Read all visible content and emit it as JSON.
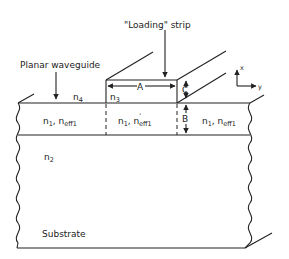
{
  "figure": {
    "labels": {
      "loading_strip": "\"Loading\" strip",
      "planar_waveguide": "Planar waveguide",
      "substrate": "Substrate",
      "n4": "n",
      "n4_sub": "4",
      "n3": "n",
      "n3_sub": "3",
      "n2": "n",
      "n2_sub": "2",
      "left_region": {
        "n": "n",
        "n_sub": "1",
        "sep": ", ",
        "neff": "n",
        "neff_sub": "eff1"
      },
      "center_region": {
        "n": "n",
        "n_sub": "1",
        "sep": ", ",
        "neff": "n",
        "neff_sup": "'",
        "neff_sub": "eff1"
      },
      "right_region": {
        "n": "n",
        "n_sub": "1",
        "sep": ", ",
        "neff": "n",
        "neff_sub": "eff1"
      },
      "dim_A": "A",
      "dim_B": "B",
      "dim_C": "C",
      "axis_x": "x",
      "axis_y": "y"
    }
  }
}
